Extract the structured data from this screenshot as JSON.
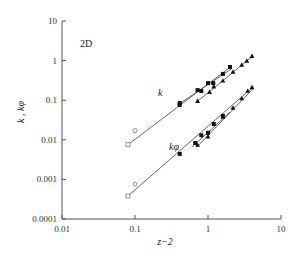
{
  "chart_data": {
    "type": "scatter",
    "title": "",
    "panel_label": "2D",
    "xlabel": "z−2",
    "ylabel": "k , kφ",
    "xscale": "log",
    "yscale": "log",
    "xlim": [
      0.01,
      10
    ],
    "ylim": [
      0.0001,
      10
    ],
    "x_ticks": [
      "0.01",
      "0.1",
      "1",
      "10"
    ],
    "y_ticks": [
      "10",
      "1",
      "0.1",
      "0.01",
      "0.001",
      "0.0001"
    ],
    "grid": false,
    "legend": null,
    "annotations": [
      {
        "text": "k",
        "near": [
          0.2,
          0.15
        ]
      },
      {
        "text": "kφ",
        "near": [
          0.3,
          0.0085
        ]
      }
    ],
    "series": [
      {
        "name": "k (open square)",
        "marker": "open-square",
        "points": [
          [
            0.08,
            0.0075
          ]
        ]
      },
      {
        "name": "k (open circle)",
        "marker": "open-circle",
        "points": [
          [
            0.1,
            0.017
          ]
        ]
      },
      {
        "name": "k (filled square)",
        "marker": "filled-square",
        "points": [
          [
            0.41,
            0.076
          ],
          [
            0.41,
            0.085
          ],
          [
            0.72,
            0.18
          ],
          [
            0.81,
            0.17
          ],
          [
            1.0,
            0.27
          ],
          [
            1.18,
            0.27
          ],
          [
            1.6,
            0.46
          ],
          [
            2.0,
            0.69
          ]
        ]
      },
      {
        "name": "k (filled triangle)",
        "marker": "filled-triangle",
        "points": [
          [
            0.72,
            0.095
          ],
          [
            1.05,
            0.16
          ],
          [
            1.2,
            0.22
          ],
          [
            1.6,
            0.31
          ],
          [
            2.2,
            0.52
          ],
          [
            2.9,
            0.78
          ],
          [
            3.4,
            0.98
          ],
          [
            4.0,
            1.3
          ]
        ]
      },
      {
        "name": "kφ (open square)",
        "marker": "open-square",
        "points": [
          [
            0.08,
            0.00038
          ]
        ]
      },
      {
        "name": "kφ (open circle)",
        "marker": "open-circle",
        "points": [
          [
            0.1,
            0.00076
          ]
        ]
      },
      {
        "name": "kφ (filled square)",
        "marker": "filled-square",
        "points": [
          [
            0.41,
            0.0044
          ],
          [
            0.67,
            0.0083
          ],
          [
            0.81,
            0.013
          ],
          [
            1.0,
            0.015
          ],
          [
            1.2,
            0.025
          ],
          [
            1.6,
            0.04
          ]
        ]
      },
      {
        "name": "kφ (filled triangle)",
        "marker": "filled-triangle",
        "points": [
          [
            0.72,
            0.0074
          ],
          [
            1.0,
            0.012
          ],
          [
            1.6,
            0.038
          ],
          [
            2.2,
            0.064
          ],
          [
            2.9,
            0.11
          ],
          [
            3.5,
            0.17
          ],
          [
            4.0,
            0.21
          ]
        ]
      }
    ],
    "fit_lines": [
      {
        "name": "k fit A",
        "from": [
          0.08,
          0.0075
        ],
        "to": [
          2.1,
          0.72
        ]
      },
      {
        "name": "k fit B",
        "from": [
          0.38,
          0.075
        ],
        "to": [
          2.1,
          0.62
        ]
      },
      {
        "name": "k fit C",
        "from": [
          0.7,
          0.09
        ],
        "to": [
          4.2,
          1.35
        ]
      },
      {
        "name": "kφ fit A",
        "from": [
          0.08,
          0.00038
        ],
        "to": [
          4.2,
          0.22
        ]
      },
      {
        "name": "kφ fit B",
        "from": [
          0.6,
          0.0065
        ],
        "to": [
          2.0,
          0.05
        ]
      },
      {
        "name": "kφ fit C",
        "from": [
          0.7,
          0.0065
        ],
        "to": [
          4.2,
          0.2
        ]
      }
    ]
  }
}
